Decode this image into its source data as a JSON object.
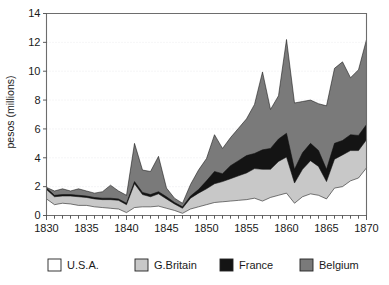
{
  "chart_data": {
    "type": "area",
    "stacked": true,
    "title": "",
    "xlabel": "",
    "ylabel": "pesos (millions)",
    "xlim": [
      1830,
      1870
    ],
    "ylim": [
      0,
      14
    ],
    "ytick_values": [
      0,
      2,
      4,
      6,
      8,
      10,
      12,
      14
    ],
    "ytick_labels": [
      "0",
      "2",
      "4",
      "6",
      "8",
      "10",
      "12",
      "14"
    ],
    "xtick_labels": [
      "1830",
      "1835",
      "1840",
      "1845",
      "1850",
      "1855",
      "1860",
      "1865",
      "1870"
    ],
    "xtick_values": [
      1830,
      1835,
      1840,
      1845,
      1850,
      1855,
      1860,
      1865,
      1870
    ],
    "xminor_step": 1,
    "grid": "horizontal-dotted",
    "legend_position": "bottom",
    "x": [
      1830,
      1831,
      1832,
      1833,
      1834,
      1835,
      1836,
      1837,
      1838,
      1839,
      1840,
      1841,
      1842,
      1843,
      1844,
      1845,
      1846,
      1847,
      1848,
      1849,
      1850,
      1851,
      1852,
      1853,
      1854,
      1855,
      1856,
      1857,
      1858,
      1859,
      1860,
      1861,
      1862,
      1863,
      1864,
      1865,
      1866,
      1867,
      1868,
      1869,
      1870
    ],
    "series": [
      {
        "name": "U.S.A.",
        "color": "#ffffff",
        "values": [
          1.15,
          0.75,
          0.85,
          0.8,
          0.7,
          0.7,
          0.6,
          0.55,
          0.5,
          0.45,
          0.2,
          0.55,
          0.6,
          0.6,
          0.65,
          0.5,
          0.35,
          0.15,
          0.45,
          0.6,
          0.75,
          0.9,
          0.95,
          1.0,
          1.05,
          1.1,
          1.2,
          1.0,
          1.25,
          1.4,
          1.55,
          0.85,
          1.3,
          1.5,
          1.4,
          1.15,
          1.9,
          2.0,
          2.4,
          2.6,
          3.3
        ]
      },
      {
        "name": "G.Britain",
        "color": "#c8c8c8",
        "values": [
          0.65,
          0.55,
          0.5,
          0.55,
          0.6,
          0.55,
          0.55,
          0.55,
          0.6,
          0.6,
          0.55,
          1.65,
          0.85,
          0.7,
          0.85,
          0.65,
          0.45,
          0.35,
          0.75,
          0.95,
          1.1,
          1.3,
          1.4,
          1.55,
          1.7,
          1.85,
          2.05,
          2.2,
          1.95,
          2.35,
          2.5,
          1.4,
          1.9,
          2.3,
          2.0,
          1.2,
          2.0,
          2.2,
          2.1,
          1.9,
          1.95
        ]
      },
      {
        "name": "France",
        "color": "#141414",
        "values": [
          0.1,
          0.1,
          0.1,
          0.1,
          0.1,
          0.1,
          0.1,
          0.1,
          0.1,
          0.1,
          0.1,
          0.15,
          0.15,
          0.15,
          0.15,
          0.15,
          0.1,
          0.1,
          0.15,
          0.25,
          0.55,
          0.85,
          0.55,
          0.9,
          1.05,
          1.2,
          1.05,
          1.35,
          1.45,
          1.55,
          1.65,
          0.95,
          1.15,
          1.2,
          1.1,
          0.85,
          1.1,
          1.0,
          1.1,
          1.05,
          1.05
        ]
      },
      {
        "name": "Belgium",
        "color": "#7a7a7a",
        "values": [
          0.05,
          0.3,
          0.4,
          0.25,
          0.45,
          0.35,
          0.3,
          0.45,
          0.9,
          0.55,
          0.55,
          2.65,
          1.55,
          1.6,
          2.45,
          0.6,
          0.3,
          0.25,
          0.8,
          1.35,
          1.55,
          2.55,
          1.75,
          1.95,
          2.25,
          2.55,
          3.4,
          5.4,
          2.7,
          3.0,
          6.5,
          4.6,
          3.55,
          3.0,
          3.25,
          4.4,
          5.2,
          5.45,
          3.95,
          4.55,
          5.9
        ]
      }
    ]
  },
  "legend": {
    "items": [
      {
        "label": "U.S.A.",
        "color": "#ffffff"
      },
      {
        "label": "G.Britain",
        "color": "#c8c8c8"
      },
      {
        "label": "France",
        "color": "#141414"
      },
      {
        "label": "Belgium",
        "color": "#7a7a7a"
      }
    ]
  }
}
